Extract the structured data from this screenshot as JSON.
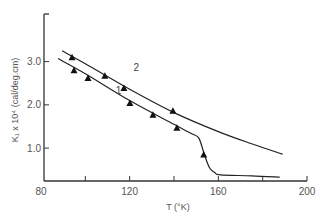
{
  "chart_data": {
    "type": "line",
    "title": "",
    "xlabel": "T (°K)",
    "ylabel": "K₁ x 10⁴ (cal/deg.cm)",
    "xlim": [
      80,
      200
    ],
    "ylim": [
      0.24,
      4.1
    ],
    "xticks": [
      80,
      100,
      120,
      140,
      160,
      180,
      200
    ],
    "xtick_labels": [
      "80",
      "",
      "120",
      "",
      "160",
      "",
      "200"
    ],
    "yticks": [
      1.0,
      2.0,
      3.0
    ],
    "ytick_labels": [
      "1.0",
      "2.0",
      "3.0"
    ],
    "grid": false,
    "legend": "none",
    "series": [
      {
        "name": "1",
        "curve": [
          [
            87.7,
            3.07
          ],
          [
            100,
            2.72
          ],
          [
            120,
            2.1
          ],
          [
            140,
            1.55
          ],
          [
            148,
            1.33
          ],
          [
            151.2,
            1.23
          ],
          [
            153.9,
            0.82
          ],
          [
            156.1,
            0.54
          ],
          [
            158.5,
            0.43
          ],
          [
            161,
            0.38
          ],
          [
            175,
            0.36
          ],
          [
            187.7,
            0.33
          ]
        ],
        "points": [
          [
            94.9,
            2.79
          ],
          [
            101.2,
            2.61
          ],
          [
            120.1,
            2.03
          ],
          [
            130.5,
            1.76
          ],
          [
            141.3,
            1.46
          ],
          [
            153.4,
            0.84
          ]
        ],
        "label_at": [
          115,
          2.25
        ]
      },
      {
        "name": "2",
        "curve": [
          [
            89.5,
            3.25
          ],
          [
            100,
            2.95
          ],
          [
            120,
            2.36
          ],
          [
            140,
            1.82
          ],
          [
            160,
            1.38
          ],
          [
            175,
            1.1
          ],
          [
            189,
            0.86
          ]
        ],
        "points": [
          [
            94.0,
            3.09
          ],
          [
            108.8,
            2.66
          ],
          [
            117.4,
            2.38
          ],
          [
            139.5,
            1.85
          ]
        ],
        "label_at": [
          123,
          2.78
        ]
      }
    ]
  }
}
